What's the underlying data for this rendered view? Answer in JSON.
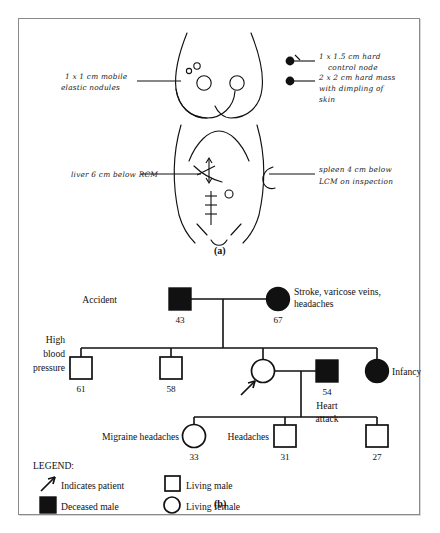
{
  "figure": {
    "panel_a_label": "(a)",
    "panel_b_label": "(b)",
    "annotations": {
      "left_breast": "1 x 1 cm mobile\nelastic nodules",
      "left_breast_line1": "1 x 1 cm mobile",
      "left_breast_line2": "elastic nodules",
      "right_breast_upper_line1": "1 x 1.5 cm hard",
      "right_breast_upper_line2": "control node",
      "right_breast_lower_line1": "2 x 2 cm hard mass",
      "right_breast_lower_line2": "with dimpling of",
      "right_breast_lower_line3": "skin",
      "liver_note": "liver 6 cm below RCM",
      "spleen_line1": "spleen 4 cm below",
      "spleen_line2": "LCM on inspection"
    }
  },
  "pedigree": {
    "generation1": [
      {
        "id": "g1-father",
        "symbol": "deceased-male",
        "label": "Accident",
        "label_position": "left",
        "age": "43"
      },
      {
        "id": "g1-mother",
        "symbol": "deceased-female",
        "label_line1": "Stroke, varicose veins,",
        "label_line2": "headaches",
        "label_position": "right",
        "age": "67"
      }
    ],
    "generation2": [
      {
        "id": "g2-child1",
        "symbol": "living-male",
        "label_line1": "High",
        "label_line2": "blood",
        "label_line3": "pressure",
        "label_position": "left",
        "age": "61"
      },
      {
        "id": "g2-child2",
        "symbol": "living-male",
        "label": "",
        "age": "58"
      },
      {
        "id": "g2-patient",
        "symbol": "living-female",
        "label": "",
        "age": "",
        "is_patient": true
      },
      {
        "id": "g2-spouse",
        "symbol": "deceased-male",
        "label_line1": "Heart",
        "label_line2": "attack",
        "label_position": "below",
        "age": "54"
      },
      {
        "id": "g2-child4",
        "symbol": "deceased-female",
        "label": "Infancy",
        "label_position": "right",
        "age": ""
      }
    ],
    "generation3": [
      {
        "id": "g3-child1",
        "symbol": "living-female",
        "label": "Migraine headaches",
        "label_position": "left",
        "age": "33"
      },
      {
        "id": "g3-child2",
        "symbol": "living-male",
        "label": "Headaches",
        "label_position": "left",
        "age": "31"
      },
      {
        "id": "g3-child3",
        "symbol": "living-male",
        "label": "",
        "age": "27"
      }
    ],
    "legend": {
      "title": "LEGEND:",
      "items": [
        {
          "icon": "arrow",
          "text": "Indicates patient"
        },
        {
          "icon": "filled-square",
          "text": "Deceased male"
        },
        {
          "icon": "filled-circle",
          "text": "Deceased female"
        },
        {
          "icon": "open-square",
          "text": "Living male"
        },
        {
          "icon": "open-circle",
          "text": "Living female"
        }
      ]
    }
  },
  "colors": {
    "ink": "#111111",
    "frame": "#8a8a8a",
    "paper": "#ffffff"
  }
}
